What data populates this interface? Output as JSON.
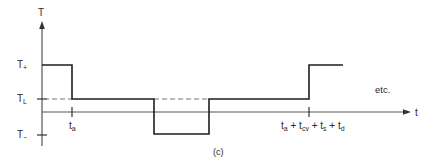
{
  "figure": {
    "caption": "(c)",
    "continuation_note": "etc.",
    "colors": {
      "waveform": "#1e1e1e",
      "axis": "#555555",
      "dashed_reference": "#777777",
      "text": "#2a2a2a"
    }
  },
  "axes": {
    "y_axis": {
      "label": "T"
    },
    "x_axis": {
      "label": "t"
    }
  },
  "levels": [
    {
      "id": "T_plus",
      "symbol": "T",
      "subscript": "+"
    },
    {
      "id": "T_L",
      "symbol": "T",
      "subscript": "L"
    },
    {
      "id": "T_minus",
      "symbol": "T",
      "subscript": "−"
    }
  ],
  "time_marks": [
    {
      "id": "ta",
      "parts": [
        {
          "s": "t",
          "sub": "a"
        }
      ]
    },
    {
      "id": "ta_tcv_ts_td",
      "parts": [
        {
          "s": "t",
          "sub": "a"
        },
        {
          "op": " + "
        },
        {
          "s": "t",
          "sub": "cv"
        },
        {
          "op": " + "
        },
        {
          "s": "t",
          "sub": "s"
        },
        {
          "op": " + "
        },
        {
          "s": "t",
          "sub": "d"
        }
      ]
    }
  ],
  "waveform": {
    "description": "Temperature setpoint sequence: T+ from 0 to ta, then TL, then pulse down to T−, back to TL, then step up to T+ at ta + tcv + ts + td, repeating (etc.)",
    "segments": [
      {
        "level": "T+",
        "from": "0",
        "to": "ta"
      },
      {
        "level": "TL",
        "from": "ta",
        "to": "start of negative pulse"
      },
      {
        "level": "T−",
        "from": "start of negative pulse",
        "to": "end of negative pulse"
      },
      {
        "level": "TL",
        "from": "end of negative pulse",
        "to": "ta + tcv + ts + td"
      },
      {
        "level": "T+",
        "from": "ta + tcv + ts + td",
        "to": "etc."
      }
    ]
  }
}
